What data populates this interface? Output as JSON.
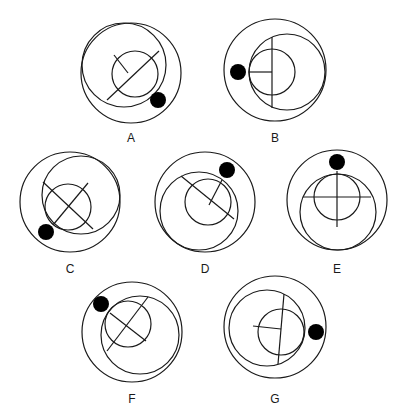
{
  "figures": [
    {
      "label": "A",
      "outer": {
        "cx": 131,
        "cy": 73,
        "r": 50
      },
      "middle": {
        "cx": 124,
        "cy": 65,
        "r": 42
      },
      "inner": {
        "cx": 135,
        "cy": 74,
        "r": 23
      },
      "lines": [
        [
          107,
          100,
          159,
          51
        ],
        [
          114,
          55,
          128,
          73
        ]
      ],
      "dot": {
        "cx": 158,
        "cy": 100,
        "r": 8
      },
      "label_pos": [
        131,
        142
      ]
    },
    {
      "label": "B",
      "outer": {
        "cx": 275,
        "cy": 70,
        "r": 51
      },
      "middle": {
        "cx": 287,
        "cy": 72,
        "r": 38
      },
      "inner": {
        "cx": 272,
        "cy": 72,
        "r": 23
      },
      "lines": [
        [
          272,
          37,
          272,
          108
        ],
        [
          249,
          72,
          272,
          72
        ]
      ],
      "dot": {
        "cx": 238,
        "cy": 72,
        "r": 8
      },
      "label_pos": [
        275,
        142
      ]
    },
    {
      "label": "C",
      "outer": {
        "cx": 70,
        "cy": 202,
        "r": 50
      },
      "middle": {
        "cx": 81,
        "cy": 195,
        "r": 39
      },
      "inner": {
        "cx": 68,
        "cy": 207,
        "r": 23
      },
      "lines": [
        [
          43,
          182,
          93,
          229
        ],
        [
          53,
          225,
          88,
          183
        ]
      ],
      "dot": {
        "cx": 46,
        "cy": 232,
        "r": 8
      },
      "label_pos": [
        70,
        273
      ]
    },
    {
      "label": "D",
      "outer": {
        "cx": 205,
        "cy": 202,
        "r": 50
      },
      "middle": {
        "cx": 199,
        "cy": 211,
        "r": 39
      },
      "inner": {
        "cx": 208,
        "cy": 202,
        "r": 23
      },
      "lines": [
        [
          181,
          176,
          234,
          219
        ],
        [
          209,
          205,
          222,
          180
        ]
      ],
      "dot": {
        "cx": 227,
        "cy": 170,
        "r": 8
      },
      "label_pos": [
        205,
        273
      ]
    },
    {
      "label": "E",
      "outer": {
        "cx": 337,
        "cy": 200,
        "r": 50
      },
      "middle": {
        "cx": 338,
        "cy": 212,
        "r": 38
      },
      "inner": {
        "cx": 337,
        "cy": 197,
        "r": 23
      },
      "lines": [
        [
          303,
          197,
          371,
          197
        ],
        [
          337,
          171,
          337,
          227
        ]
      ],
      "dot": {
        "cx": 337,
        "cy": 162,
        "r": 8
      },
      "label_pos": [
        337,
        273
      ]
    },
    {
      "label": "F",
      "outer": {
        "cx": 132,
        "cy": 332,
        "r": 50
      },
      "middle": {
        "cx": 140,
        "cy": 335,
        "r": 39
      },
      "inner": {
        "cx": 128,
        "cy": 324,
        "r": 23
      },
      "lines": [
        [
          107,
          351,
          148,
          297
        ],
        [
          110,
          313,
          146,
          341
        ]
      ],
      "dot": {
        "cx": 101,
        "cy": 304,
        "r": 8
      },
      "label_pos": [
        132,
        403
      ]
    },
    {
      "label": "G",
      "outer": {
        "cx": 275,
        "cy": 327,
        "r": 51
      },
      "middle": {
        "cx": 267,
        "cy": 328,
        "r": 38
      },
      "inner": {
        "cx": 281,
        "cy": 332,
        "r": 23
      },
      "lines": [
        [
          284,
          294,
          278,
          364
        ],
        [
          253,
          326,
          281,
          329
        ]
      ],
      "dot": {
        "cx": 316,
        "cy": 332,
        "r": 8
      },
      "label_pos": [
        275,
        403
      ]
    }
  ]
}
